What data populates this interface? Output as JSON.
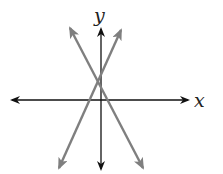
{
  "figure": {
    "type": "coordinate-plane-two-lines",
    "axes": {
      "x_label": "x",
      "y_label": "y",
      "color": "#111111"
    },
    "lines": [
      {
        "name": "rising-line",
        "slope_sign": "positive",
        "color": "#7f7f7f"
      },
      {
        "name": "falling-line",
        "slope_sign": "negative",
        "color": "#7f7f7f"
      }
    ],
    "intersection": "second quadrant near the y-axis, above the x-axis"
  }
}
